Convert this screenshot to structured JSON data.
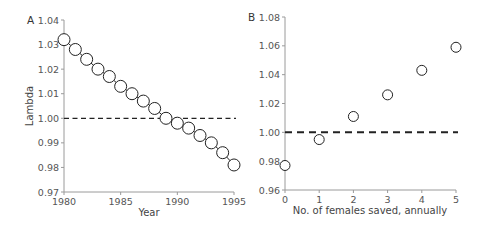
{
  "chart_data": [
    {
      "panel": "A",
      "type": "line",
      "title": "",
      "xlabel": "Year",
      "ylabel": "Lambda",
      "x": [
        1980,
        1981,
        1982,
        1983,
        1984,
        1985,
        1986,
        1987,
        1988,
        1989,
        1990,
        1991,
        1992,
        1993,
        1994,
        1995
      ],
      "values": [
        1.032,
        1.028,
        1.024,
        1.02,
        1.017,
        1.013,
        1.01,
        1.007,
        1.004,
        1.0,
        0.998,
        0.996,
        0.993,
        0.99,
        0.986,
        0.981
      ],
      "xlim": [
        1980,
        1995
      ],
      "ylim": [
        0.97,
        1.04
      ],
      "xticks": [
        "1980",
        "1985",
        "1990",
        "1995"
      ],
      "yticks": [
        "0.97",
        "0.98",
        "0.99",
        "1.00",
        "1.01",
        "1.02",
        "1.03",
        "1.04"
      ],
      "reference_line": {
        "y": 1.0,
        "style": "dashed"
      },
      "marker": "open-circle",
      "grid": false
    },
    {
      "panel": "B",
      "type": "scatter",
      "title": "",
      "xlabel": "No. of females saved, annually",
      "ylabel": "",
      "x": [
        0,
        1,
        2,
        3,
        4,
        5
      ],
      "values": [
        0.977,
        0.995,
        1.011,
        1.026,
        1.043,
        1.059
      ],
      "xlim": [
        0,
        5
      ],
      "ylim": [
        0.96,
        1.08
      ],
      "xticks": [
        "0",
        "1",
        "2",
        "3",
        "4",
        "5"
      ],
      "yticks": [
        "0.96",
        "0.98",
        "1.00",
        "1.02",
        "1.04",
        "1.06",
        "1.08"
      ],
      "reference_line": {
        "y": 1.0,
        "style": "dashed"
      },
      "marker": "open-circle",
      "grid": false
    }
  ],
  "panels": {
    "a": {
      "label": "A",
      "ylabel": "Lambda",
      "xlabel": "Year",
      "yticks": [
        "1.04",
        "1.03",
        "1.02",
        "1.01",
        "1.00",
        "0.99",
        "0.98",
        "0.97"
      ],
      "xticks": [
        "1980",
        "1985",
        "1990",
        "1995"
      ]
    },
    "b": {
      "label": "B",
      "xlabel": "No. of females saved, annually",
      "yticks": [
        "1.08",
        "1.06",
        "1.04",
        "1.02",
        "1.00",
        "0.98",
        "0.96"
      ],
      "xticks": [
        "0",
        "1",
        "2",
        "3",
        "4",
        "5"
      ]
    }
  },
  "colors": {
    "axis": "#9a9a9a",
    "line": "#222222",
    "marker_stroke": "#222222",
    "marker_fill": "#ffffff",
    "reference_line": "#222222"
  }
}
